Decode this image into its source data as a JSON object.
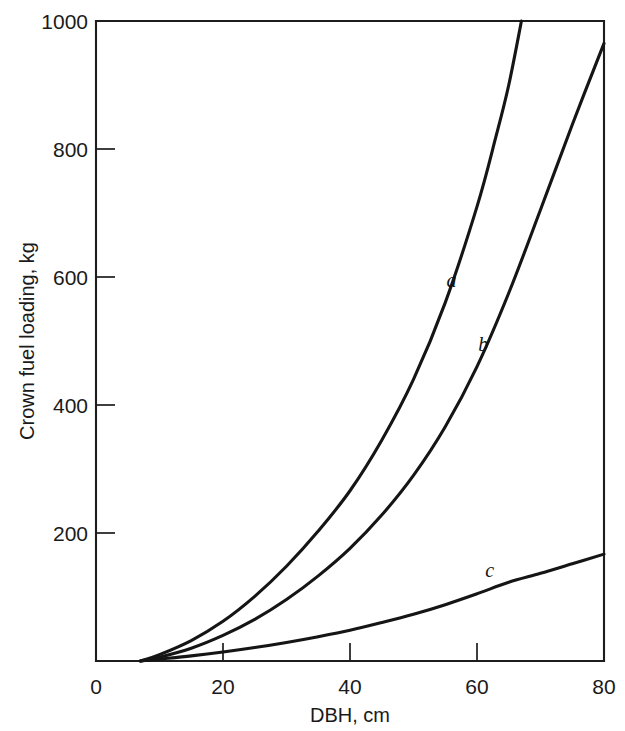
{
  "chart_data": {
    "type": "line",
    "title": "",
    "xlabel": "DBH, cm",
    "ylabel": "Crown fuel loading, kg",
    "xlim": [
      0,
      80
    ],
    "ylim": [
      0,
      1000
    ],
    "grid": false,
    "legend": "inline-curve-labels",
    "x_ticks": [
      0,
      20,
      40,
      60,
      80
    ],
    "x_tick_labels": [
      "0",
      "20",
      "40",
      "60",
      "80"
    ],
    "y_ticks": [
      200,
      400,
      600,
      800,
      1000
    ],
    "y_tick_labels": [
      "200",
      "400",
      "600",
      "800",
      "1000"
    ],
    "series": [
      {
        "name": "a",
        "label": "a",
        "label_x": 56,
        "label_y": 585,
        "x": [
          7,
          10,
          15,
          20,
          25,
          30,
          35,
          40,
          45,
          50,
          55,
          60,
          63,
          65,
          67
        ],
        "values": [
          0,
          10,
          32,
          62,
          101,
          148,
          203,
          266,
          345,
          440,
          560,
          710,
          820,
          900,
          1000
        ]
      },
      {
        "name": "b",
        "label": "b",
        "label_x": 61,
        "label_y": 485,
        "x": [
          7,
          10,
          15,
          20,
          25,
          30,
          35,
          40,
          45,
          50,
          55,
          60,
          65,
          70,
          75,
          80
        ],
        "values": [
          0,
          6,
          20,
          40,
          65,
          96,
          133,
          176,
          228,
          290,
          366,
          460,
          575,
          705,
          838,
          965
        ]
      },
      {
        "name": "c",
        "label": "c",
        "label_x": 62,
        "label_y": 131,
        "x": [
          7,
          10,
          15,
          20,
          25,
          30,
          35,
          40,
          45,
          50,
          55,
          60,
          65,
          70,
          75,
          80
        ],
        "values": [
          0,
          3,
          8,
          14,
          21,
          29,
          38,
          48,
          60,
          73,
          88,
          105,
          123,
          137,
          152,
          167
        ]
      }
    ]
  }
}
